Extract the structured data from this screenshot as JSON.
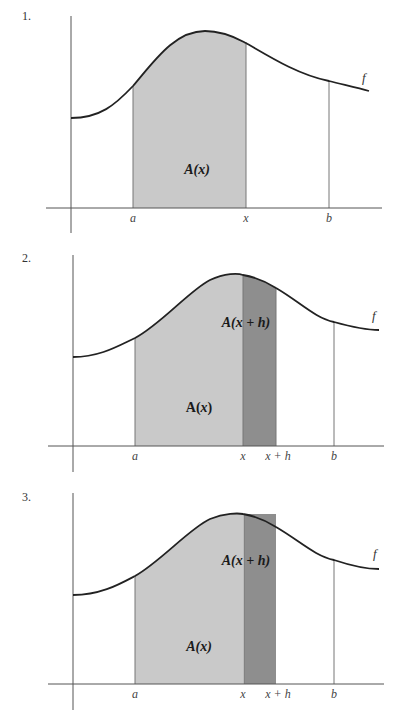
{
  "colors": {
    "axis": "#555555",
    "curve": "#222222",
    "region_light": "#c9c9c9",
    "region_dark": "#8e8e8e",
    "vline": "#777777"
  },
  "panels": [
    {
      "number": "1.",
      "number_pos": [
        22,
        9
      ],
      "y_axis": {
        "x": 71,
        "y1": 16,
        "y2": 233
      },
      "x_axis": {
        "y": 208,
        "x1": 46,
        "x2": 382
      },
      "curve": "M71,118 C100,118 115,105 133,86 C155,60 175,31 205,31 C225,31 240,40 246,43 C275,60 300,75 329,81 C345,85 358,88 369,91",
      "regions": [
        {
          "kind": "light",
          "path": "M133,208 L133,86 C155,60 175,31 205,31 C225,31 240,40 246,43 L246,208 Z"
        }
      ],
      "vlines": [
        {
          "x": 133,
          "y1": 86,
          "y2": 208
        },
        {
          "x": 246,
          "y1": 43,
          "y2": 208
        },
        {
          "x": 329,
          "y1": 81,
          "y2": 208
        }
      ],
      "tick_labels": [
        {
          "text": "a",
          "x": 133,
          "y": 211
        },
        {
          "text": "x",
          "x": 246,
          "y": 211
        },
        {
          "text": "b",
          "x": 329,
          "y": 211
        }
      ],
      "f_label": {
        "text": "f",
        "x": 362,
        "y": 70
      },
      "area_labels": [
        {
          "name": "area-label-A-x",
          "text_main": "A(",
          "text_var": "x",
          "text_end": ")",
          "x": 197,
          "y": 170,
          "italic": true
        }
      ]
    },
    {
      "number": "2.",
      "number_pos": [
        22,
        251
      ],
      "y_axis": {
        "x": 73,
        "y1": 255,
        "y2": 472
      },
      "x_axis": {
        "y": 446,
        "x1": 48,
        "x2": 384
      },
      "curve": "M73,357 C100,357 118,346 135,338 C160,325 190,290 210,280 C225,273 238,273 243,275 C255,277 268,283 276,288 C300,302 315,318 334,322 C352,327 365,330 379,330",
      "regions": [
        {
          "kind": "light",
          "path": "M135,446 L135,338 C160,325 190,290 210,280 C225,273 238,273 243,275 L243,446 Z"
        },
        {
          "kind": "dark",
          "path": "M243,446 L243,275 C255,277 268,283 276,288 L276,446 Z"
        }
      ],
      "vlines": [
        {
          "x": 135,
          "y1": 338,
          "y2": 446
        },
        {
          "x": 243,
          "y1": 275,
          "y2": 446
        },
        {
          "x": 276,
          "y1": 288,
          "y2": 446
        },
        {
          "x": 334,
          "y1": 322,
          "y2": 446
        }
      ],
      "tick_labels": [
        {
          "text": "a",
          "x": 135,
          "y": 449
        },
        {
          "text": "x",
          "x": 243,
          "y": 449
        },
        {
          "text": "x + h",
          "x": 278,
          "y": 449
        },
        {
          "text": "b",
          "x": 334,
          "y": 449
        }
      ],
      "f_label": {
        "text": "f",
        "x": 372,
        "y": 308
      },
      "area_labels": [
        {
          "name": "area-label-A-x-plus-h",
          "text_main": "A(",
          "text_var": "x + h",
          "text_end": ")",
          "x": 246,
          "y": 323,
          "italic": true
        },
        {
          "name": "area-label-A-x",
          "text_main": "A(",
          "text_var": "x",
          "text_end": ")",
          "x": 199,
          "y": 408,
          "italic": false
        }
      ]
    },
    {
      "number": "3.",
      "number_pos": [
        22,
        490
      ],
      "y_axis": {
        "x": 73,
        "y1": 493,
        "y2": 710
      },
      "x_axis": {
        "y": 684,
        "x1": 48,
        "x2": 384
      },
      "curve": "M73,595 C100,595 118,585 135,576 C160,562 190,528 210,519 C225,513 238,513 243,514 C255,516 268,522 276,527 C300,541 315,556 334,560 C352,566 365,569 379,569",
      "regions": [
        {
          "kind": "light",
          "path": "M135,684 L135,576 C160,562 190,528 210,519 C225,513 238,513 243,514 L243,684 Z"
        },
        {
          "kind": "dark",
          "path": "M244,684 L244,514 L276,514 L276,684 Z"
        }
      ],
      "vlines": [
        {
          "x": 135,
          "y1": 576,
          "y2": 684
        },
        {
          "x": 244,
          "y1": 514,
          "y2": 684
        },
        {
          "x": 334,
          "y1": 560,
          "y2": 684
        }
      ],
      "tick_labels": [
        {
          "text": "a",
          "x": 135,
          "y": 687
        },
        {
          "text": "x",
          "x": 243,
          "y": 687
        },
        {
          "text": "x + h",
          "x": 278,
          "y": 687
        },
        {
          "text": "b",
          "x": 334,
          "y": 687
        }
      ],
      "f_label": {
        "text": "f",
        "x": 373,
        "y": 546
      },
      "area_labels": [
        {
          "name": "area-label-A-x-plus-h",
          "text_main": "A(",
          "text_var": "x + h",
          "text_end": ")",
          "x": 246,
          "y": 561,
          "italic": true
        },
        {
          "name": "area-label-A-x",
          "text_main": "A(",
          "text_var": "x",
          "text_end": ")",
          "x": 199,
          "y": 647,
          "italic": true
        }
      ]
    }
  ]
}
